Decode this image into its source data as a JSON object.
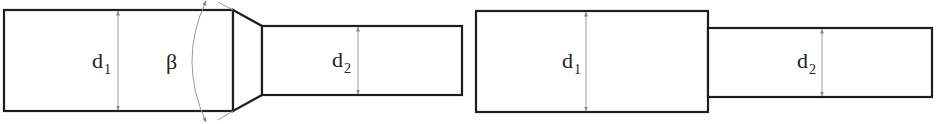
{
  "figures": [
    {
      "name": "tapered-transition",
      "labels": {
        "d1_main": "d",
        "d1_sub": "1",
        "angle": "β",
        "d2_main": "d",
        "d2_sub": "2"
      }
    },
    {
      "name": "abrupt-step",
      "labels": {
        "d1_main": "d",
        "d1_sub": "1",
        "d2_main": "d",
        "d2_sub": "2"
      }
    }
  ],
  "colors": {
    "outline": "#1e1e1e",
    "dimension": "#9a9a9a",
    "background": "#ffffff"
  }
}
